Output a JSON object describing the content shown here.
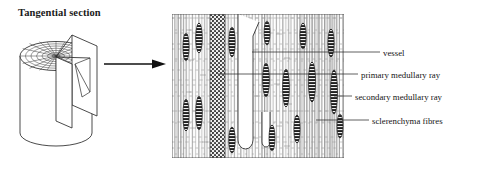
{
  "figure": {
    "title": "Tangential section",
    "domain": "botany-histology-diagram",
    "arrow": {
      "name": "flow-arrow",
      "direction": "right"
    }
  },
  "block_diagram": {
    "name": "wood-cylinder-block",
    "description": "cylindrical wood block with radial-grid transverse top face and a cut-away tangential plane"
  },
  "section_panel": {
    "name": "tangential-section-micrograph",
    "description": "tangential longitudinal section showing vertical fibre files, fusiform uniseriate rays, a broad multiseriate ray and a vessel"
  },
  "labels": [
    {
      "id": "vessel",
      "text": "vessel"
    },
    {
      "id": "primary-medullary-ray",
      "text": "primary medullary ray"
    },
    {
      "id": "secondary-medullary-ray",
      "text": "secondary medullary ray"
    },
    {
      "id": "sclerenchyma-fibres",
      "text": "sclerenchyma fibres"
    }
  ],
  "colors": {
    "ink": "#1a1a1a",
    "line": "#2b2b2b",
    "cell_wall": "#8d8d8d",
    "ray_fill": "#262626",
    "primary_ray_fill": "#555555",
    "background": "#ffffff"
  }
}
